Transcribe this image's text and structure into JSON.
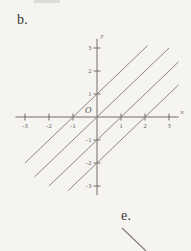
{
  "page": {
    "background_color": "#f6f4f1",
    "ink_color": "#706d6a"
  },
  "labels": {
    "part_b": "b.",
    "part_e": "e."
  },
  "chart_data": {
    "type": "line",
    "title": "",
    "xlabel": "x",
    "ylabel": "y",
    "xlim": [
      -3.4,
      3.4
    ],
    "ylim": [
      -3.4,
      3.4
    ],
    "grid": false,
    "legend": "none",
    "origin_label": "O",
    "xticks": [
      -3,
      -2,
      -1,
      1,
      2,
      3
    ],
    "xtick_labels": [
      "-3",
      "-2",
      "-1",
      "1",
      "2",
      "3"
    ],
    "yticks": [
      3,
      2,
      1,
      -1,
      -2,
      -3
    ],
    "ytick_labels": [
      "3",
      "2",
      "1",
      "-1",
      "-2",
      "-3"
    ],
    "series": [
      {
        "name": "y = x + 1",
        "slope": 1,
        "intercept": 1,
        "x_intercept": -1,
        "x_range": [
          -3.0,
          2.1
        ],
        "color": "#8b8885"
      },
      {
        "name": "y = x",
        "slope": 1,
        "intercept": 0,
        "x_intercept": 0,
        "x_range": [
          -2.6,
          3.0
        ],
        "color": "#8b8885"
      },
      {
        "name": "y = x - 1",
        "slope": 1,
        "intercept": -1,
        "x_intercept": 1,
        "x_range": [
          -2.0,
          3.4
        ],
        "color": "#8b8885"
      },
      {
        "name": "y = x - 2",
        "slope": 1,
        "intercept": -2,
        "x_intercept": 2,
        "x_range": [
          -1.2,
          3.4
        ],
        "color": "#8b8885"
      }
    ]
  },
  "tail_figure": {
    "name": "partial-line-segment",
    "description": "short diagonal stroke descending to the right below label e."
  }
}
